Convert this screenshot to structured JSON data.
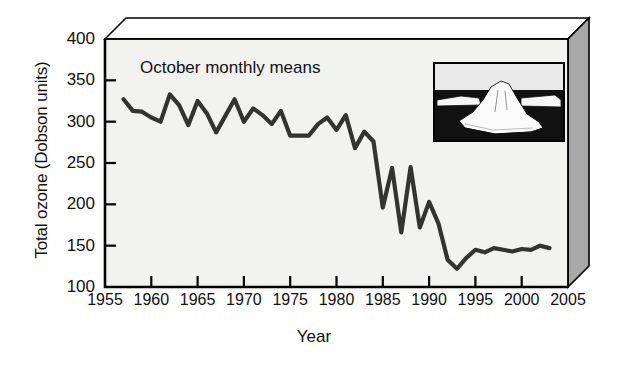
{
  "figure": {
    "kind": "scientific-line-chart",
    "background": "#ffffff",
    "frame_face": "#f2f2f0",
    "frame_side": "#a8a8a8",
    "line_color": "#333333"
  },
  "chart_data": {
    "type": "line",
    "title": "October monthly means",
    "xlabel": "Year",
    "ylabel": "Total ozone (Dobson units)",
    "xlim": [
      1955,
      2005
    ],
    "ylim": [
      100,
      400
    ],
    "xticks": [
      1955,
      1960,
      1965,
      1970,
      1975,
      1980,
      1985,
      1990,
      1995,
      2000,
      2005
    ],
    "yticks": [
      100,
      150,
      200,
      250,
      300,
      350,
      400
    ],
    "grid": false,
    "legend": null,
    "series": [
      {
        "name": "October mean total ozone",
        "x": [
          1957,
          1958,
          1959,
          1960,
          1961,
          1962,
          1963,
          1964,
          1965,
          1966,
          1967,
          1968,
          1969,
          1970,
          1971,
          1972,
          1973,
          1974,
          1975,
          1976,
          1977,
          1978,
          1979,
          1980,
          1981,
          1982,
          1983,
          1984,
          1985,
          1986,
          1987,
          1988,
          1989,
          1990,
          1991,
          1992,
          1993,
          1994,
          1995,
          1996,
          1997,
          1998,
          1999,
          2000,
          2001,
          2002,
          2003
        ],
        "values": [
          327,
          313,
          312,
          305,
          300,
          333,
          320,
          296,
          325,
          310,
          287,
          307,
          327,
          300,
          316,
          308,
          297,
          313,
          283,
          283,
          283,
          297,
          305,
          290,
          308,
          268,
          288,
          276,
          196,
          244,
          166,
          245,
          172,
          203,
          177,
          133,
          122,
          135,
          145,
          142,
          147,
          145,
          143,
          146,
          145,
          150,
          147
        ]
      }
    ],
    "annotations": [
      {
        "text": "October monthly means",
        "x": 1963,
        "y": 355
      }
    ],
    "inset": {
      "name": "iceberg-photo",
      "description": "black and white photograph of an iceberg"
    }
  },
  "axis": {
    "ytick_labels": [
      "400",
      "350",
      "300",
      "250",
      "200",
      "150",
      "100"
    ],
    "xtick_labels": [
      "1955",
      "1960",
      "1965",
      "1970",
      "1975",
      "1980",
      "1985",
      "1990",
      "1995",
      "2000",
      "2005"
    ]
  }
}
